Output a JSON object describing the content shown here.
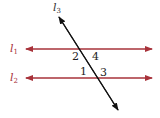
{
  "diagram": {
    "colors": {
      "parallel_lines": "#a8323a",
      "transversal": "#111111",
      "angle_labels": "#222222"
    },
    "lines": [
      {
        "id": "l1",
        "label": "l",
        "subscript": "1",
        "kind": "parallel",
        "y": 49
      },
      {
        "id": "l2",
        "label": "l",
        "subscript": "2",
        "kind": "parallel",
        "y": 78
      },
      {
        "id": "l3",
        "label": "l",
        "subscript": "3",
        "kind": "transversal"
      }
    ],
    "angles": [
      {
        "label": "2",
        "position": "upper-left at l1"
      },
      {
        "label": "4",
        "position": "upper-right at l1"
      },
      {
        "label": "1",
        "position": "upper-left at l2"
      },
      {
        "label": "3",
        "position": "upper-right at l2"
      }
    ]
  }
}
